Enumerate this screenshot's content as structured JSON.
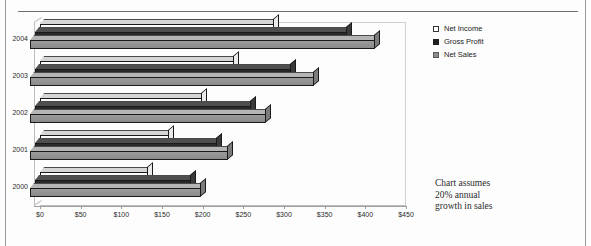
{
  "chart_data": {
    "type": "bar",
    "orientation": "horizontal",
    "style": "3d-grouped-horizontal-bar",
    "title": "",
    "subtitle": "",
    "xlabel": "",
    "ylabel": "",
    "categories": [
      "2000",
      "2001",
      "2002",
      "2003",
      "2004"
    ],
    "series": [
      {
        "name": "Net Income",
        "values": [
          133,
          159,
          199,
          239,
          288
        ],
        "color": "#f2f2f2"
      },
      {
        "name": "Gross Profit",
        "values": [
          192,
          224,
          265,
          315,
          383
        ],
        "color": "#1f1f1f"
      },
      {
        "name": "Net Sales",
        "values": [
          210,
          244,
          290,
          349,
          424
        ],
        "color": "#8c8c8c"
      }
    ],
    "xlim": [
      0,
      450
    ],
    "xticks": [
      0,
      50,
      100,
      150,
      200,
      250,
      300,
      350,
      400,
      450
    ],
    "xtick_labels": [
      "$0",
      "$50",
      "$100",
      "$150",
      "$200",
      "$250",
      "$300",
      "$350",
      "$400",
      "$450"
    ],
    "grid": false,
    "legend_position": "right",
    "legend_entries": [
      "Net Income",
      "Gross Profit",
      "Net Sales"
    ],
    "annotations": [
      "Chart assumes 20% annual growth in sales"
    ]
  },
  "legend": {
    "items": [
      {
        "label": "Net Income",
        "swatch": "net-income"
      },
      {
        "label": "Gross Profit",
        "swatch": "gross-profit"
      },
      {
        "label": "Net Sales",
        "swatch": "net-sales"
      }
    ]
  },
  "note": {
    "line1": "Chart assumes",
    "line2": "20% annual",
    "line3": "growth in sales"
  }
}
